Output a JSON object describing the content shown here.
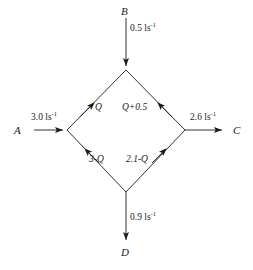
{
  "diagram": {
    "type": "flow-network",
    "nodes": [
      {
        "id": "A",
        "label": "A",
        "role": "source-left"
      },
      {
        "id": "B",
        "label": "B",
        "role": "source-top"
      },
      {
        "id": "C",
        "label": "C",
        "role": "sink-right"
      },
      {
        "id": "D",
        "label": "D",
        "role": "sink-bottom"
      }
    ],
    "external_flows": [
      {
        "id": "inflow-b",
        "value": "0.5",
        "unit_base": "ls",
        "unit_exp": "-1",
        "direction": "down",
        "from": "B",
        "to": "top-junction"
      },
      {
        "id": "inflow-a",
        "value": "3.0",
        "unit_base": "ls",
        "unit_exp": "-1",
        "direction": "right",
        "from": "A",
        "to": "left-junction"
      },
      {
        "id": "outflow-c",
        "value": "2.6",
        "unit_base": "ls",
        "unit_exp": "-1",
        "direction": "right",
        "from": "right-junction",
        "to": "C"
      },
      {
        "id": "outflow-d",
        "value": "0.9",
        "unit_base": "ls",
        "unit_exp": "-1",
        "direction": "down",
        "from": "bottom-junction",
        "to": "D"
      }
    ],
    "internal_edges": [
      {
        "id": "edge-upper-left",
        "label": "Q",
        "from": "left-junction",
        "to": "top-junction",
        "arrow": "up-right"
      },
      {
        "id": "edge-upper-right",
        "label": "Q+0.5",
        "from": "right-junction",
        "to": "top-junction",
        "arrow": "up-left"
      },
      {
        "id": "edge-lower-left",
        "label": "3-Q",
        "from": "bottom-junction",
        "to": "left-junction",
        "arrow": "down-left"
      },
      {
        "id": "edge-lower-right",
        "label": "2.1-Q",
        "from": "bottom-junction",
        "to": "right-junction",
        "arrow": "up-right"
      }
    ],
    "colors": {
      "stroke": "#1a1a1a",
      "text": "#1a1a1a",
      "background": "#ffffff"
    }
  }
}
